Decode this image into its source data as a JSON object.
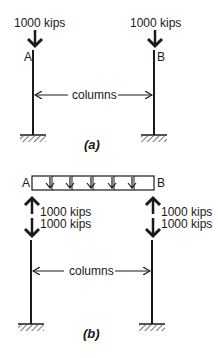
{
  "diagram": {
    "part_a": {
      "caption": "(a)",
      "load_left": "1000 kips",
      "load_right": "1000 kips",
      "node_left": "A",
      "node_right": "B",
      "columns_label": "columns"
    },
    "part_b": {
      "caption": "(b)",
      "node_left": "A",
      "node_right": "B",
      "left_up_force": "1000 kips",
      "left_down_force": "1000 kips",
      "right_up_force": "1000 kips",
      "right_down_force": "1000 kips",
      "columns_label": "columns",
      "distributed_load_arrow_count": 5
    },
    "colors": {
      "stroke": "#1a1a1a",
      "background": "#ffffff"
    }
  }
}
